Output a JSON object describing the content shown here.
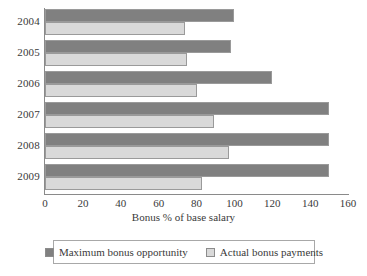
{
  "chart_data": {
    "type": "bar",
    "orientation": "horizontal",
    "title": "",
    "xlabel": "Bonus % of base salary",
    "ylabel": "",
    "xlim": [
      0,
      160
    ],
    "xticks": [
      0,
      20,
      40,
      60,
      80,
      100,
      120,
      140,
      160
    ],
    "grid": false,
    "legend_position": "bottom",
    "categories": [
      "2004",
      "2005",
      "2006",
      "2007",
      "2008",
      "2009"
    ],
    "series": [
      {
        "name": "Maximum bonus opportunity",
        "color": "#808080",
        "values": [
          100,
          98,
          120,
          150,
          150,
          150
        ]
      },
      {
        "name": "Actual bonus payments",
        "color": "#d9d9d9",
        "values": [
          74,
          75,
          80,
          89,
          97,
          83
        ]
      }
    ]
  },
  "axis": {
    "x_title": "Bonus % of base salary",
    "x_tick_labels": [
      "0",
      "20",
      "40",
      "60",
      "80",
      "100",
      "120",
      "140",
      "160"
    ],
    "y_tick_labels": [
      "2004",
      "2005",
      "2006",
      "2007",
      "2008",
      "2009"
    ]
  },
  "legend": {
    "entries": [
      {
        "label": "Maximum bonus opportunity",
        "swatch": "dark-gray-swatch"
      },
      {
        "label": "Actual bonus payments",
        "swatch": "light-gray-swatch"
      }
    ]
  },
  "colors": {
    "series_max": "#808080",
    "series_actual": "#d9d9d9",
    "axis": "#8a8a8a",
    "text": "#3a3a3a",
    "background": "#ffffff"
  }
}
